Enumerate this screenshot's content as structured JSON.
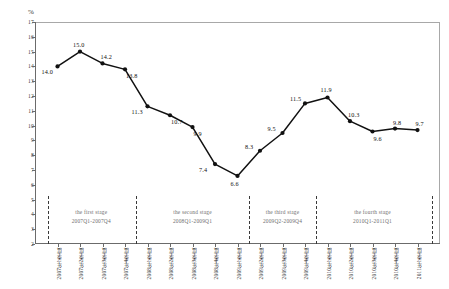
{
  "chart_data": {
    "type": "line",
    "title": "",
    "subtitle": "",
    "xlabel": "",
    "ylabel": "%",
    "unit_label": "%",
    "grid": false,
    "legend": "none",
    "ylim": [
      2,
      17
    ],
    "ytick_step": 1,
    "yticks": [
      "17",
      "16",
      "15",
      "14",
      "13",
      "12",
      "11",
      "10",
      "9",
      "8",
      "7",
      "6",
      "5",
      "4",
      "3",
      "2"
    ],
    "categories": [
      "2007年1季度",
      "2007年2季度",
      "2007年3季度",
      "2007年4季度",
      "2008年1季度",
      "2008年2季度",
      "2008年3季度",
      "2008年4季度",
      "2009年1季度",
      "2009年2季度",
      "2009年3季度",
      "2009年4季度",
      "2010年1季度",
      "2010年2季度",
      "2010年3季度",
      "2010年4季度",
      "2011年1季度"
    ],
    "values": [
      14.0,
      15.0,
      14.2,
      13.8,
      11.3,
      10.7,
      9.9,
      7.4,
      6.6,
      8.3,
      9.5,
      11.5,
      11.9,
      10.3,
      9.6,
      9.8,
      9.7
    ],
    "point_labels": [
      "14.0",
      "15.0",
      "14.2",
      "13.8",
      "11.3",
      "10.7",
      "9.9",
      "7.4",
      "6.6",
      "8.3",
      "9.5",
      "11.5",
      "11.9",
      "10.3",
      "9.6",
      "9.8",
      "9.7"
    ],
    "series_color": "#111111",
    "annotations": [
      {
        "name": "the first stage",
        "range": "2007Q1-2007Q4"
      },
      {
        "name": "the second stage",
        "range": "2008Q1-2009Q1"
      },
      {
        "name": "the third stage",
        "range": "2009Q2-2009Q4"
      },
      {
        "name": "the fourth stage",
        "range": "2010Q1-2011Q1"
      }
    ]
  }
}
